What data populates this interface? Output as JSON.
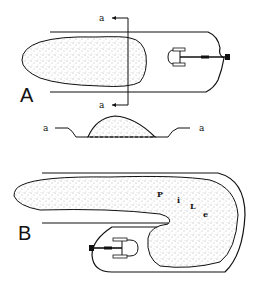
{
  "diagram": {
    "panels": [
      {
        "id": "A",
        "label": "A",
        "section_marks": {
          "top": "a",
          "bottom": "a"
        },
        "description": "Stockpile on a strip with a crawler dozer pushing material; section line a–a cut across the pile"
      },
      {
        "id": "B",
        "label": "B",
        "pile_label_letters": [
          "P",
          "i",
          "L",
          "e"
        ],
        "description": "Pile curled in a hook shape around a cleared area containing a crawler dozer"
      }
    ],
    "cross_section": {
      "left_label": "a",
      "right_label": "a",
      "description": "Cross-section a–a showing mound of material in a shallow trench, dashed base line"
    },
    "colors": {
      "ink": "#111111",
      "stipple": "#555555",
      "background": "#ffffff"
    }
  }
}
